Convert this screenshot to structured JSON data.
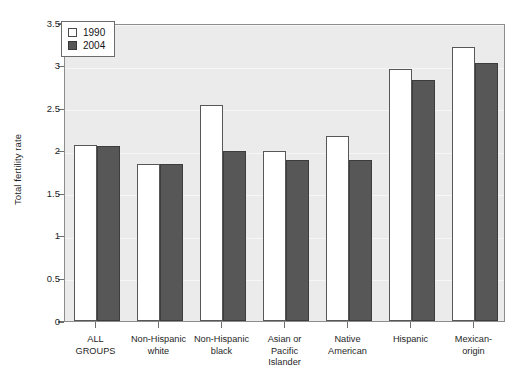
{
  "chart_data": {
    "type": "bar",
    "title": "",
    "xlabel": "",
    "ylabel": "Total fertility rate",
    "ylim": [
      0,
      3.5
    ],
    "ytick_labels": [
      "0",
      "0.5",
      "1",
      "1.5",
      "2",
      "2.5",
      "3",
      "3.5"
    ],
    "ytick_values": [
      0,
      0.5,
      1,
      1.5,
      2,
      2.5,
      3,
      3.5
    ],
    "grid": true,
    "legend_position": "top-left",
    "categories": [
      "ALL GROUPS",
      "Non-Hispanic white",
      "Non-Hispanic black",
      "Asian or Pacific Islander",
      "Native American",
      "Hispanic",
      "Mexican-origin"
    ],
    "category_lines": [
      [
        "ALL",
        "GROUPS"
      ],
      [
        "Non-Hispanic",
        "white"
      ],
      [
        "Non-Hispanic",
        "black"
      ],
      [
        "Asian or",
        "Pacific",
        "Islander"
      ],
      [
        "Native",
        "American"
      ],
      [
        "Hispanic"
      ],
      [
        "Mexican-",
        "origin"
      ]
    ],
    "series": [
      {
        "name": "1990",
        "color": "#ffffff",
        "values": [
          2.07,
          1.85,
          2.54,
          2.0,
          2.17,
          2.96,
          3.22
        ]
      },
      {
        "name": "2004",
        "color": "#575757",
        "values": [
          2.06,
          1.85,
          2.0,
          1.89,
          1.89,
          2.83,
          3.03
        ]
      }
    ]
  },
  "legend": {
    "items": [
      {
        "label": "1990"
      },
      {
        "label": "2004"
      }
    ]
  },
  "colors": {
    "series_1990": "#ffffff",
    "series_2004": "#575757",
    "plot_background": "#ebebeb",
    "axis": "#8d8d8d",
    "text": "#1f1f1f"
  }
}
